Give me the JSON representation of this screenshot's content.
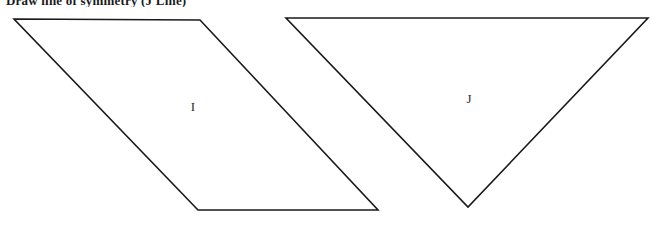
{
  "document": {
    "title": "Draw line of symmetry (J Line)",
    "background_color": "#ffffff",
    "stroke_color": "#1a1a1a",
    "label_color": "#2b2b2b",
    "width": 662,
    "height": 225
  },
  "figures": [
    {
      "id": "shape-i",
      "label": "I",
      "type": "parallelogram",
      "points": "14,19 200,20 378,210 198,210",
      "label_x": 193,
      "label_y": 111
    },
    {
      "id": "shape-j",
      "label": "J",
      "type": "triangle",
      "points": "286,18 648,18 468,207",
      "label_x": 469,
      "label_y": 103
    }
  ]
}
